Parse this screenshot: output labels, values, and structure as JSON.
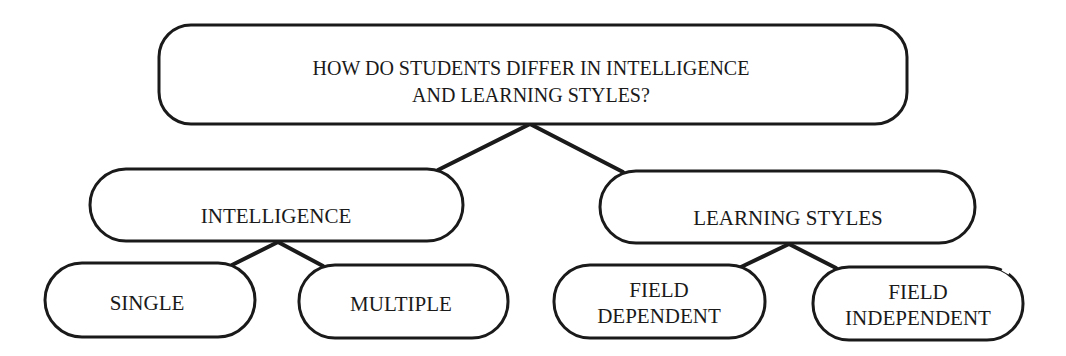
{
  "diagram": {
    "type": "concept-hierarchy",
    "root": {
      "id": "root",
      "lines": [
        "HOW DO STUDENTS DIFFER IN INTELLIGENCE",
        "AND LEARNING STYLES?"
      ]
    },
    "level1": [
      {
        "id": "intelligence",
        "lines": [
          "INTELLIGENCE"
        ]
      },
      {
        "id": "learning-styles",
        "lines": [
          "LEARNING STYLES"
        ]
      }
    ],
    "level2": [
      {
        "id": "single",
        "parent": "intelligence",
        "lines": [
          "SINGLE"
        ]
      },
      {
        "id": "multiple",
        "parent": "intelligence",
        "lines": [
          "MULTIPLE"
        ]
      },
      {
        "id": "field-dependent",
        "parent": "learning-styles",
        "lines": [
          "FIELD",
          "DEPENDENT"
        ]
      },
      {
        "id": "field-independent",
        "parent": "learning-styles",
        "lines": [
          "FIELD",
          "INDEPENDENT"
        ]
      }
    ],
    "edges": [
      {
        "from": "root",
        "to": "intelligence"
      },
      {
        "from": "root",
        "to": "learning-styles"
      },
      {
        "from": "intelligence",
        "to": "single"
      },
      {
        "from": "intelligence",
        "to": "multiple"
      },
      {
        "from": "learning-styles",
        "to": "field-dependent"
      },
      {
        "from": "learning-styles",
        "to": "field-independent"
      }
    ],
    "colors": {
      "stroke": "#1a1a1a",
      "fill": "#ffffff",
      "text": "#1a1a1a"
    }
  }
}
